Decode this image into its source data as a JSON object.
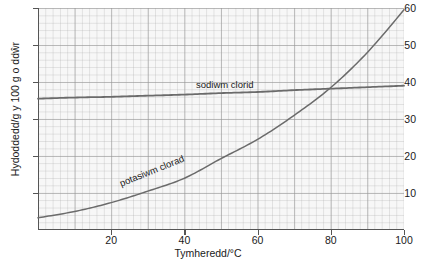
{
  "chart_data": {
    "type": "line",
    "title": "",
    "xlabel": "Tymheredd/°C",
    "ylabel": "Hydoddedd/g y 100 g o ddŵr",
    "xlim": [
      0,
      100
    ],
    "ylim": [
      0,
      60
    ],
    "xticks": [
      20,
      40,
      60,
      80,
      100
    ],
    "yticks": [
      10,
      20,
      30,
      40,
      50,
      60
    ],
    "grid": true,
    "legend_position": "inline-on-curve",
    "series": [
      {
        "name": "sodiwm clorid",
        "color": "#6b6b6b",
        "x": [
          0,
          10,
          20,
          30,
          40,
          50,
          60,
          70,
          80,
          90,
          100
        ],
        "values": [
          35.5,
          35.8,
          36.0,
          36.3,
          36.6,
          37.0,
          37.3,
          37.8,
          38.2,
          38.6,
          39.0
        ]
      },
      {
        "name": "potasiwm clorad",
        "color": "#6b6b6b",
        "x": [
          0,
          10,
          20,
          30,
          40,
          50,
          60,
          70,
          80,
          90,
          100
        ],
        "values": [
          3.3,
          5.0,
          7.4,
          10.5,
          14.0,
          19.3,
          24.5,
          31.0,
          38.5,
          48.0,
          59.5
        ]
      }
    ],
    "annotations": [
      {
        "text": "sodiwm clorid",
        "x": 55,
        "y": 40.5
      },
      {
        "text": "potasiwm clorad",
        "x": 26,
        "y": 14.5
      }
    ]
  },
  "axes": {
    "y_tick_labels": [
      "60",
      "50",
      "40",
      "30",
      "20",
      "10"
    ],
    "x_tick_labels": [
      "20",
      "40",
      "60",
      "80",
      "100"
    ],
    "x_title": "Tymheredd/°C",
    "y_title": "Hydoddedd/g y 100 g o ddŵr"
  },
  "labels": {
    "sodiwm": "sodiwm clorid",
    "potasiwm": "potasiwm clorad"
  },
  "colors": {
    "curve": "#6b6b6b",
    "axis": "#555555",
    "plot_background": "#f7f7f7",
    "grid_minor": "#aaaaaa",
    "grid_major": "#969696",
    "text": "#1a1a1a",
    "page_background": "#ffffff"
  }
}
